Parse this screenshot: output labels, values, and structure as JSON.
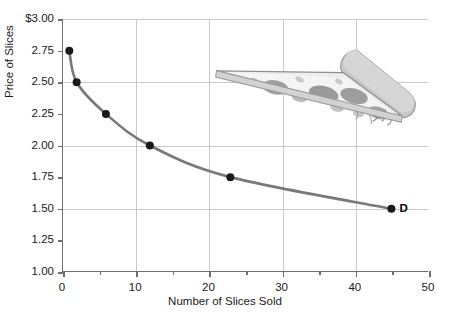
{
  "chart_data": {
    "type": "line",
    "title": "",
    "xlabel": "Number of Slices Sold",
    "ylabel": "Price of Slices",
    "xlim": [
      0,
      50
    ],
    "ylim": [
      1.0,
      3.0
    ],
    "grid": true,
    "legend_position": "inline-right-end",
    "series": [
      {
        "name": "D",
        "label": "D",
        "color": "#787878",
        "marker_color": "#1a1a1a",
        "x": [
          1,
          2,
          6,
          12,
          23,
          45
        ],
        "y": [
          2.75,
          2.5,
          2.25,
          2.0,
          1.75,
          1.5
        ]
      }
    ],
    "annotations": [
      {
        "name": "demand-curve-label",
        "text": "D",
        "x": 45,
        "y": 1.5
      }
    ],
    "xticks": [
      0,
      10,
      20,
      30,
      40,
      50
    ],
    "xtick_labels": [
      "0",
      "10",
      "20",
      "30",
      "40",
      "50"
    ],
    "xminor_ticks": [
      5,
      15,
      25,
      35,
      45
    ],
    "yticks": [
      1.0,
      1.25,
      1.5,
      1.75,
      2.0,
      2.25,
      2.5,
      2.75,
      3.0
    ],
    "ytick_labels": [
      "1.00",
      "1.25",
      "1.50",
      "1.75",
      "2.00",
      "2.25",
      "2.50",
      "2.75",
      "$3.00"
    ],
    "ygridlines": [
      1.5,
      2.0,
      2.5,
      3.0
    ],
    "xgridlines": [
      10,
      20,
      30,
      40
    ]
  },
  "decoration": {
    "pizza_slice": {
      "name": "pizza-slice-illustration",
      "description": "grayscale pizza slice with pepperoni",
      "crust_color": "#c4c4c4",
      "cheese_color": "#ededed",
      "pepperoni_color": "#9a9a9a",
      "outline_color": "#8a8a8a"
    }
  },
  "colors": {
    "curve": "#787878",
    "marker": "#1a1a1a",
    "axis": "#6f6f6f",
    "grid": "#c9c9c9",
    "text": "#1a1a1a",
    "background": "#ffffff"
  }
}
